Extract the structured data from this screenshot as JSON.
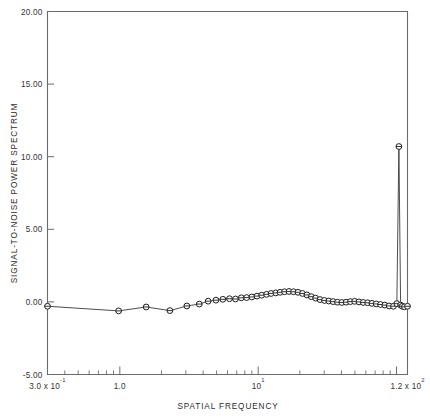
{
  "chart_data": {
    "type": "line",
    "title": "",
    "xlabel": "SPATIAL FREQUENCY",
    "ylabel": "SIGNAL-TO-NOISE POWER SPECTRUM",
    "xscale": "log",
    "yscale": "linear",
    "xlim": [
      0.3,
      120
    ],
    "ylim": [
      -5.0,
      20.0
    ],
    "grid": false,
    "legend": null,
    "marker": "circle-with-horizontal-bar",
    "y_ticks": [
      -5.0,
      0.0,
      5.0,
      10.0,
      15.0,
      20.0
    ],
    "y_tick_labels": [
      "-5.00",
      "0.00",
      "5.00",
      "10.00",
      "15.00",
      "20.00"
    ],
    "x_tick_labels": [
      {
        "value": 0.3,
        "text": "3.0 x 10",
        "exponent": "-1"
      },
      {
        "value": 1.0,
        "text": "1.0",
        "exponent": ""
      },
      {
        "value": 10.0,
        "text": "10",
        "exponent": "1"
      },
      {
        "value": 120.0,
        "text": "1.2 x 10",
        "exponent": "2"
      }
    ],
    "series": [
      {
        "name": "signal-to-noise power spectrum",
        "x": [
          0.3,
          0.98,
          1.55,
          2.3,
          3.05,
          3.75,
          4.35,
          4.95,
          5.55,
          6.2,
          6.85,
          7.55,
          8.25,
          9.0,
          9.8,
          10.6,
          11.5,
          12.4,
          13.4,
          14.4,
          15.5,
          16.7,
          18.0,
          19.4,
          20.9,
          22.5,
          24.2,
          26.0,
          28.0,
          30.1,
          32.4,
          34.8,
          37.4,
          40.2,
          43.2,
          46.4,
          49.8,
          53.5,
          57.5,
          61.8,
          66.4,
          71.3,
          76.6,
          82.3,
          88.4,
          95.0,
          100.5,
          104.0,
          107.0,
          110.0,
          114.0,
          120.0
        ],
        "y": [
          -0.3,
          -0.62,
          -0.35,
          -0.6,
          -0.28,
          -0.15,
          0.05,
          0.12,
          0.18,
          0.22,
          0.2,
          0.28,
          0.3,
          0.34,
          0.4,
          0.46,
          0.52,
          0.58,
          0.62,
          0.66,
          0.7,
          0.72,
          0.7,
          0.66,
          0.58,
          0.48,
          0.36,
          0.26,
          0.16,
          0.1,
          0.06,
          0.02,
          -0.02,
          -0.04,
          -0.02,
          0.02,
          0.04,
          0.0,
          -0.04,
          -0.06,
          -0.1,
          -0.14,
          -0.18,
          -0.22,
          -0.28,
          -0.3,
          -0.12,
          10.7,
          -0.22,
          -0.3,
          -0.34,
          -0.3
        ]
      }
    ],
    "annotations": [
      {
        "label": "sharp spike",
        "x": 104.0,
        "y": 10.7
      }
    ]
  }
}
